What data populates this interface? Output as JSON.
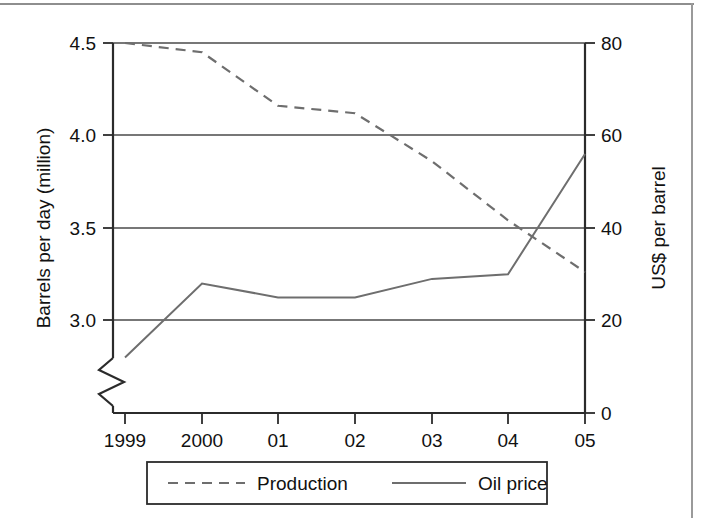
{
  "figure": {
    "background_color": "#ffffff",
    "frame_color": "#8e8e8e",
    "line_color": "#6e6e6e",
    "axis_color": "#2b2b2b"
  },
  "chart_data": {
    "type": "line",
    "title": "",
    "subtitle": "",
    "xlabel": "",
    "categories": [
      "1999",
      "2000",
      "01",
      "02",
      "03",
      "04",
      "05"
    ],
    "x": [
      1999,
      2000,
      2001,
      2002,
      2003,
      2004,
      2005
    ],
    "grid": true,
    "legend_position": "bottom",
    "axes": {
      "left": {
        "label": "Barrels per day (million)",
        "ticks": [
          "4.5",
          "4.0",
          "3.5",
          "3.0"
        ],
        "tick_values": [
          4.5,
          4.0,
          3.5,
          3.0
        ],
        "ylim": [
          3.0,
          4.5
        ],
        "axis_break": true,
        "break_note": "zigzag break below 3.0"
      },
      "right": {
        "label": "US$ per barrel",
        "ticks": [
          "0",
          "20",
          "40",
          "60",
          "80"
        ],
        "tick_values": [
          0,
          20,
          40,
          60,
          80
        ],
        "ylim": [
          0,
          80
        ]
      }
    },
    "series": [
      {
        "name": "Production",
        "axis": "left",
        "style": "dashed",
        "unit": "million barrels per day",
        "values": [
          4.5,
          4.45,
          4.16,
          4.12,
          3.86,
          3.54,
          3.26
        ]
      },
      {
        "name": "Oil price",
        "axis": "right",
        "style": "solid",
        "unit": "US$ per barrel",
        "values": [
          12,
          28,
          25,
          25,
          29,
          30,
          56
        ]
      }
    ]
  },
  "legend": {
    "entries": [
      {
        "label": "Production",
        "style": "dashed"
      },
      {
        "label": "Oil price",
        "style": "solid"
      }
    ]
  }
}
